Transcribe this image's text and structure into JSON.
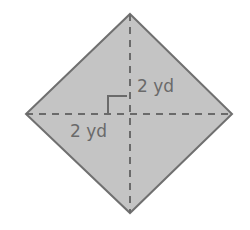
{
  "diagram": {
    "shape": "square (rotated as rhombus/diamond)",
    "fill_color": "#c4c4c4",
    "stroke_color": "#707070",
    "dash_color": "#6a6a6a",
    "labels": {
      "vertical_half_diagonal": "2 yd",
      "horizontal_half_diagonal": "2 yd"
    },
    "right_angle_marker": true
  }
}
